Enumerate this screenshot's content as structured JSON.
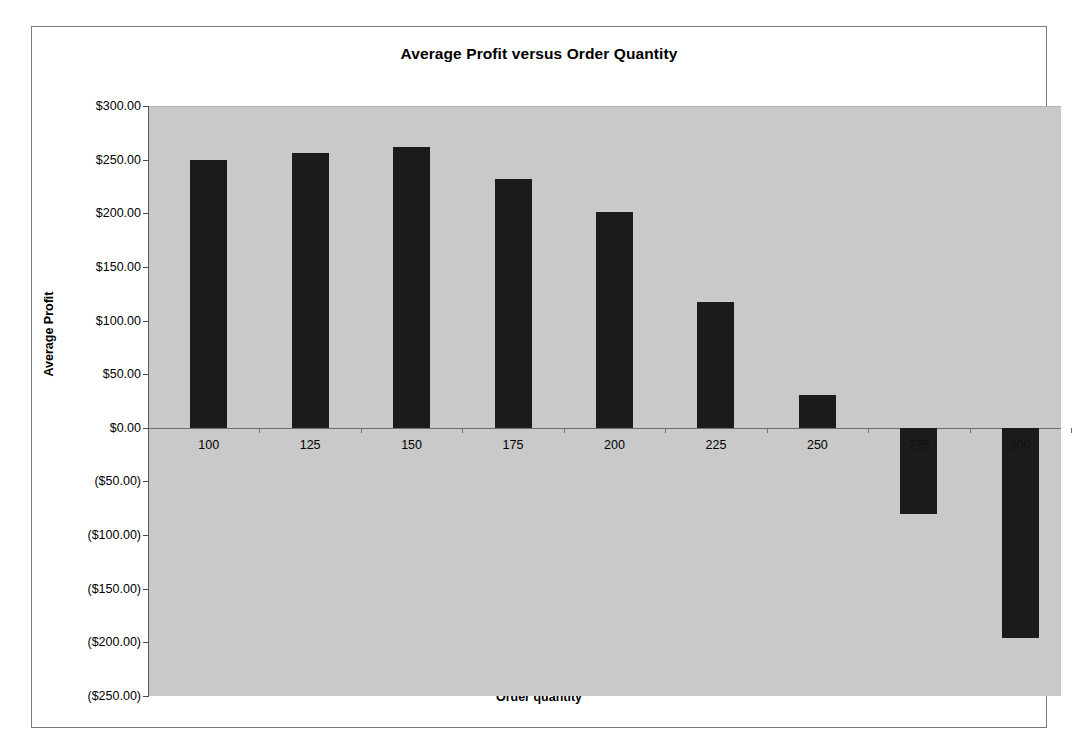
{
  "chart_data": {
    "type": "bar",
    "title": "Average Profit versus Order Quantity",
    "xlabel": "Order quantity",
    "ylabel": "Average Profit",
    "categories": [
      "100",
      "125",
      "150",
      "175",
      "200",
      "225",
      "250",
      "275",
      "300"
    ],
    "values": [
      250,
      256,
      262,
      232,
      201,
      117,
      31,
      -80,
      -196
    ],
    "ylim": [
      -250,
      300
    ],
    "ytick_values": [
      300,
      250,
      200,
      150,
      100,
      50,
      0,
      -50,
      -100,
      -150,
      -200,
      -250
    ],
    "ytick_labels": [
      "$300.00",
      "$250.00",
      "$200.00",
      "$150.00",
      "$100.00",
      "$50.00",
      "$0.00",
      "($50.00)",
      "($100.00)",
      "($150.00)",
      "($200.00)",
      "($250.00)"
    ],
    "grid": false,
    "legend": false,
    "bar_color": "#1b1b1b",
    "plot_background": "#c9c9c9",
    "figure_background": "#ffffff",
    "note_hidden_labels": "The 275 and 300 category labels are drawn in dark text over the dark negative bars and are not legible."
  }
}
